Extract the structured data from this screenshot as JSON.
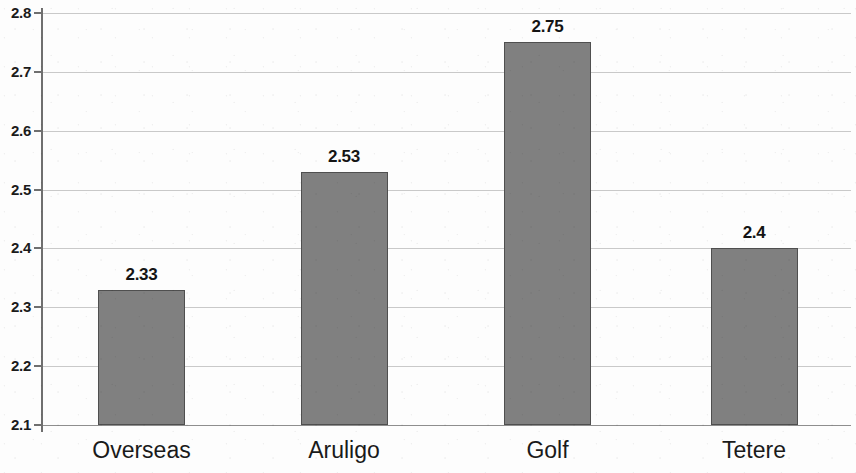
{
  "chart_data": {
    "type": "bar",
    "title": "",
    "subtitle": "",
    "xlabel": "",
    "ylabel": "",
    "categories": [
      "Overseas",
      "Aruligo",
      "Golf",
      "Tetere"
    ],
    "values": [
      2.33,
      2.53,
      2.75,
      2.4
    ],
    "data_labels": [
      "2.33",
      "2.53",
      "2.75",
      "2.4"
    ],
    "series": [
      {
        "name": "",
        "values": [
          2.33,
          2.53,
          2.75,
          2.4
        ]
      }
    ],
    "ylim": [
      2.1,
      2.8
    ],
    "y_tick_step": 0.1,
    "y_ticks": [
      2.8,
      2.7,
      2.6,
      2.5,
      2.4,
      2.3,
      2.2,
      2.1
    ],
    "y_tick_labels": [
      "2.8",
      "2.7",
      "2.6",
      "2.5",
      "2.4",
      "2.3",
      "2.2",
      "2.1"
    ],
    "grid": true,
    "grid_axis": "y",
    "legend": false,
    "legend_position": "none",
    "colors": {
      "bar_fill": "#808080",
      "bar_border": "#4f4f4f",
      "gridline": "#c9c9c9",
      "axis": "#6f6f6f",
      "text": "#1a1a1a",
      "background": "#fdfdfd"
    }
  }
}
